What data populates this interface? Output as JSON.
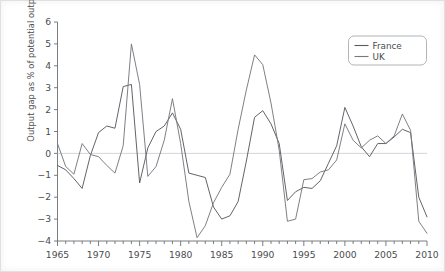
{
  "chart_data": {
    "type": "line",
    "title": "",
    "xlabel": "",
    "ylabel": "Output gap as % of potential output",
    "xlim": [
      1965,
      2010
    ],
    "ylim": [
      -4,
      6
    ],
    "ytick_step": 1,
    "yticks": [
      6,
      5,
      4,
      3,
      2,
      1,
      0,
      -1,
      -2,
      -3,
      -4
    ],
    "ytick_labels": [
      "6",
      "5",
      "4",
      "3",
      "2",
      "1",
      "0",
      "−1",
      "−2",
      "−3",
      "−4"
    ],
    "xticks_major": [
      1965,
      1970,
      1975,
      1980,
      1985,
      1990,
      1995,
      2000,
      2005,
      2010
    ],
    "xtick_labels": [
      "1965",
      "1970",
      "1975",
      "1980",
      "1985",
      "1990",
      "1995",
      "2000",
      "2005",
      "2010"
    ],
    "xtick_minor_step": 1,
    "grid": false,
    "zero_line": true,
    "zero_line_color": "#c9cacd",
    "legend_position": "top-right",
    "x": [
      1965,
      1966,
      1967,
      1968,
      1969,
      1970,
      1971,
      1972,
      1973,
      1974,
      1975,
      1976,
      1977,
      1978,
      1979,
      1980,
      1981,
      1982,
      1983,
      1984,
      1985,
      1986,
      1987,
      1988,
      1989,
      1990,
      1991,
      1992,
      1993,
      1994,
      1995,
      1996,
      1997,
      1998,
      1999,
      2000,
      2001,
      2002,
      2003,
      2004,
      2005,
      2006,
      2007,
      2008,
      2009,
      2010
    ],
    "series": [
      {
        "name": "France",
        "color": "#5a5c60",
        "values": [
          -0.55,
          -0.75,
          -1.15,
          -1.6,
          -0.1,
          0.95,
          1.25,
          1.15,
          3.05,
          3.15,
          -1.35,
          0.25,
          1.0,
          1.25,
          1.85,
          1.1,
          -0.9,
          -1.0,
          -1.1,
          -2.45,
          -3.0,
          -2.85,
          -2.2,
          -0.35,
          1.65,
          1.95,
          1.35,
          0.45,
          -2.15,
          -1.75,
          -1.55,
          -1.6,
          -1.25,
          -0.45,
          0.35,
          2.1,
          1.25,
          0.3,
          -0.15,
          0.45,
          0.45,
          0.75,
          1.1,
          0.95,
          -2.0,
          -2.9
        ]
      },
      {
        "name": "UK",
        "color": "#77797e",
        "values": [
          0.45,
          -0.6,
          -0.95,
          0.45,
          -0.05,
          -0.15,
          -0.55,
          -0.9,
          0.35,
          5.0,
          3.15,
          -1.05,
          -0.6,
          0.6,
          2.5,
          0.45,
          -2.2,
          -3.85,
          -3.3,
          -2.25,
          -1.55,
          -0.95,
          1.1,
          2.9,
          4.5,
          4.05,
          2.3,
          0.15,
          -3.1,
          -3.0,
          -1.2,
          -1.15,
          -0.85,
          -0.75,
          -0.3,
          1.35,
          0.6,
          0.25,
          0.6,
          0.8,
          0.45,
          0.8,
          1.8,
          1.05,
          -3.1,
          -3.65
        ]
      }
    ]
  },
  "legend": {
    "entries": [
      {
        "label": "France"
      },
      {
        "label": "UK"
      }
    ]
  }
}
